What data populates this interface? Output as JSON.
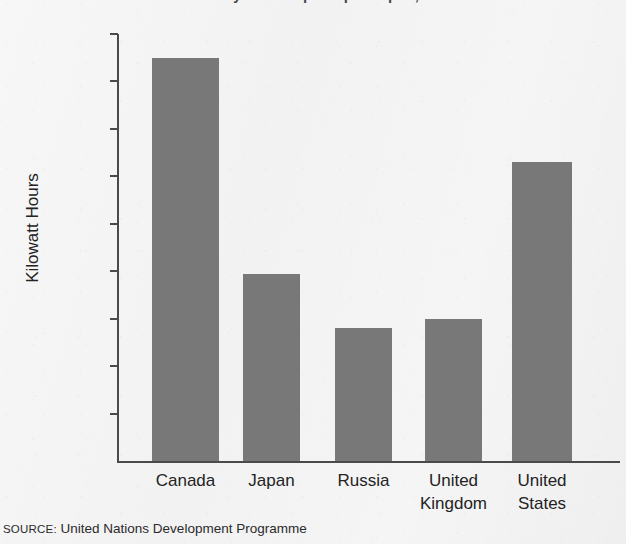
{
  "chart_data": {
    "type": "bar",
    "title": "Electricity consumption per capita, 2001",
    "title_clipped": true,
    "subtitle": "",
    "xlabel": "",
    "ylabel": "Kilowatt Hours",
    "categories": [
      "Canada",
      "Japan",
      "Russia",
      "United Kingdom",
      "United States"
    ],
    "category_lines": [
      [
        "Canada"
      ],
      [
        "Japan"
      ],
      [
        "Russia"
      ],
      [
        "United",
        "Kingdom"
      ],
      [
        "United",
        "States"
      ]
    ],
    "values": [
      17000,
      7900,
      5600,
      6000,
      12600
    ],
    "ylim": [
      0,
      18000
    ],
    "ytick_values": [
      2000,
      4000,
      6000,
      8000,
      10000,
      12000,
      14000,
      16000,
      18000
    ],
    "ytick_labels": [
      "2,000",
      "4,000",
      "6,000",
      "8,000",
      "10,000",
      "12,000",
      "14,000",
      "16,000",
      "18,000"
    ],
    "grid": false,
    "legend": null,
    "legend_position": "none",
    "bar_color": "#787878",
    "axis_color": "#4a4a4a",
    "background_color": "#f4f4f4"
  },
  "source": {
    "keyword": "SOURCE:",
    "text": "United Nations Development Programme",
    "full": "SOURCE: United Nations Development Programme"
  }
}
